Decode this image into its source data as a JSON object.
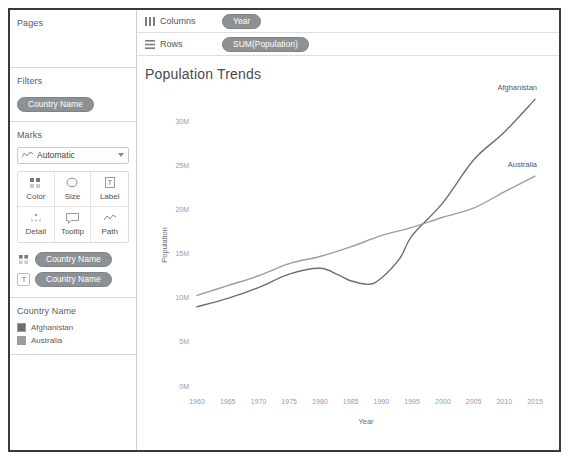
{
  "sidebar": {
    "pages": {
      "title": "Pages"
    },
    "filters": {
      "title": "Filters",
      "pills": [
        {
          "label": "Country Name",
          "icon": "dimension-pill-icon"
        }
      ]
    },
    "marks": {
      "title": "Marks",
      "mark_type": {
        "label": "Automatic",
        "icon": "line-chart-icon",
        "caret": "chevron-down-icon"
      },
      "buttons": [
        {
          "label": "Color",
          "icon": "color-icon"
        },
        {
          "label": "Size",
          "icon": "size-icon"
        },
        {
          "label": "Label",
          "icon": "label-icon"
        },
        {
          "label": "Detail",
          "icon": "detail-icon"
        },
        {
          "label": "Tooltip",
          "icon": "tooltip-icon"
        },
        {
          "label": "Path",
          "icon": "path-icon"
        }
      ],
      "chips": [
        {
          "label": "Country Name",
          "icon": "color-icon"
        },
        {
          "label": "Country Name",
          "icon": "label-icon"
        }
      ]
    },
    "legend": {
      "title": "Country Name",
      "entries": [
        {
          "label": "Afghanistan",
          "color": "#6e6e6e"
        },
        {
          "label": "Australia",
          "color": "#9e9e9e"
        }
      ]
    }
  },
  "shelves": [
    {
      "name": "Columns",
      "icon": "columns-icon",
      "pill": "Year"
    },
    {
      "name": "Rows",
      "icon": "rows-icon",
      "pill": "SUM(Population)"
    }
  ],
  "viz": {
    "title": "Population Trends"
  },
  "chart_data": {
    "type": "line",
    "title": "Population Trends",
    "xlabel": "Year",
    "ylabel": "Population",
    "xlim": [
      1960,
      2015
    ],
    "ylim": [
      0,
      32000000
    ],
    "xticks": [
      1960,
      1965,
      1970,
      1975,
      1980,
      1985,
      1990,
      1995,
      2000,
      2005,
      2010,
      2015
    ],
    "yticks": [
      0,
      5000000,
      10000000,
      15000000,
      20000000,
      25000000,
      30000000
    ],
    "ytick_labels": [
      "0M",
      "5M",
      "10M",
      "15M",
      "20M",
      "25M",
      "30M"
    ],
    "xtick_labels": [
      "1960",
      "1965",
      "1970",
      "1975",
      "1980",
      "1985",
      "1990",
      "1995",
      "2000",
      "2005",
      "2010",
      "2015"
    ],
    "grid": false,
    "legend_position": "left-sidebar",
    "series": [
      {
        "name": "Afghanistan",
        "color": "#6e6e6e",
        "label_anchor": "end-of-line",
        "x": [
          1960,
          1965,
          1970,
          1975,
          1980,
          1983,
          1985,
          1988,
          1990,
          1993,
          1995,
          2000,
          2005,
          2010,
          2015
        ],
        "values": [
          8996351,
          9938414,
          11173654,
          12689160,
          13356500,
          12600000,
          11938208,
          11540888,
          12249114,
          14485543,
          17065836,
          20779953,
          25654277,
          28803167,
          32526562
        ]
      },
      {
        "name": "Australia",
        "color": "#9e9e9e",
        "label_anchor": "end-of-line",
        "x": [
          1960,
          1965,
          1970,
          1975,
          1980,
          1985,
          1990,
          1995,
          2000,
          2005,
          2010,
          2015
        ],
        "values": [
          10276477,
          11387750,
          12507349,
          13893000,
          14695400,
          15788300,
          17065100,
          18004882,
          19153000,
          20176844,
          22031750,
          23815995
        ]
      }
    ]
  }
}
